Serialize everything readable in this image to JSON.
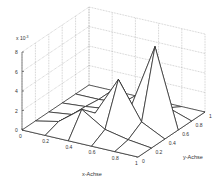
{
  "chart_data": {
    "type": "surface-mesh-3d",
    "title": "",
    "xlabel": "x-Achse",
    "ylabel": "y-Achse",
    "zlabel": "",
    "z_multiplier_label": "x 10",
    "z_multiplier_exponent": "-3",
    "x_ticks": [
      "0",
      "0.2",
      "0.4",
      "0.6",
      "0.8",
      "1"
    ],
    "y_ticks": [
      "0",
      "0.2",
      "0.4",
      "0.6",
      "0.8",
      "1"
    ],
    "z_ticks": [
      "0",
      "2",
      "4",
      "6",
      "8"
    ],
    "xlim": [
      0,
      1
    ],
    "ylim": [
      0,
      1
    ],
    "zlim": [
      0,
      8
    ],
    "grid": true,
    "x": [
      0,
      0.2,
      0.4,
      0.6,
      0.8,
      1
    ],
    "y": [
      0,
      0.2,
      0.4,
      0.6,
      0.8,
      1
    ],
    "z_rows_by_y": [
      [
        0,
        0,
        0,
        0,
        0,
        0
      ],
      [
        0,
        0.5,
        2.3,
        0.8,
        0.3,
        0
      ],
      [
        0,
        0.3,
        1.0,
        5.0,
        1.2,
        0
      ],
      [
        0,
        0.2,
        0.5,
        1.5,
        8.0,
        0
      ],
      [
        0,
        0,
        0.2,
        0.4,
        0.8,
        0
      ],
      [
        0,
        0,
        0,
        0,
        0,
        0
      ]
    ],
    "z_units_note": "values shown in units of 10^-3"
  }
}
